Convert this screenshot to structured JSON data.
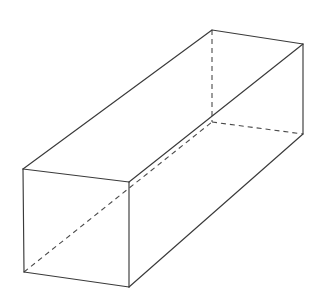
{
  "figure": {
    "background_color": "#ffffff",
    "solid_edge_color": "#3a3a3a",
    "hidden_edge_color": "#4a4a4a",
    "solid_edge_width": 1.15,
    "hidden_edge_width": 1.1,
    "hidden_dash_pattern": "5 4",
    "canvas": {
      "width": 311,
      "height": 294
    },
    "vertices": {
      "front_top_left": {
        "x": 23,
        "y": 169
      },
      "front_top_right": {
        "x": 129,
        "y": 182
      },
      "front_bottom_left": {
        "x": 24,
        "y": 272
      },
      "front_bottom_right": {
        "x": 129,
        "y": 287
      },
      "back_top_left": {
        "x": 212,
        "y": 30
      },
      "back_top_right": {
        "x": 303,
        "y": 44
      },
      "back_bottom_left": {
        "x": 212,
        "y": 122
      },
      "back_bottom_right": {
        "x": 303,
        "y": 134
      }
    },
    "faces": [
      {
        "name": "top-face",
        "vertex_order": "front_top_left, front_top_right, back_top_right, back_top_left"
      },
      {
        "name": "front-face",
        "vertex_order": "front_top_left, front_top_right, front_bottom_right, front_bottom_left"
      },
      {
        "name": "right-face",
        "vertex_order": "front_top_right, back_top_right, back_bottom_right, front_bottom_right"
      }
    ],
    "solid_edges": [
      {
        "name": "edge-front-top",
        "from": "front_top_left",
        "to": "front_top_right"
      },
      {
        "name": "edge-front-left-vertical",
        "from": "front_top_left",
        "to": "front_bottom_left"
      },
      {
        "name": "edge-front-right-vertical",
        "from": "front_top_right",
        "to": "front_bottom_right"
      },
      {
        "name": "edge-front-bottom",
        "from": "front_bottom_left",
        "to": "front_bottom_right"
      },
      {
        "name": "edge-top-left-long",
        "from": "front_top_left",
        "to": "back_top_left"
      },
      {
        "name": "edge-top-right-long",
        "from": "front_top_right",
        "to": "back_top_right"
      },
      {
        "name": "edge-back-top",
        "from": "back_top_left",
        "to": "back_top_right"
      },
      {
        "name": "edge-back-right-vertical",
        "from": "back_top_right",
        "to": "back_bottom_right"
      },
      {
        "name": "edge-bottom-right-long",
        "from": "front_bottom_right",
        "to": "back_bottom_right"
      }
    ],
    "hidden_edges": [
      {
        "name": "hidden-edge-back-left-vertical",
        "from": "back_top_left",
        "to": "back_bottom_left"
      },
      {
        "name": "hidden-edge-back-bottom",
        "from": "back_bottom_left",
        "to": "back_bottom_right"
      },
      {
        "name": "hidden-edge-bottom-left-long",
        "from": "front_bottom_left",
        "to": "back_bottom_left"
      }
    ]
  }
}
